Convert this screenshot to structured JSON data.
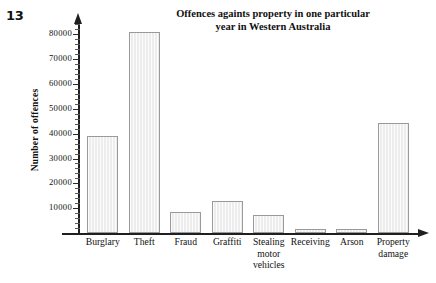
{
  "question_number": "13",
  "chart_data": {
    "type": "bar",
    "title": "Offences againts property in one particular year in Western Australia",
    "title_line1": "Offences againts property in one particular",
    "title_line2": "year in Western Australia",
    "xlabel": "",
    "ylabel": "Number of offences",
    "ylim": [
      0,
      85000
    ],
    "ytick_step": 10000,
    "minor_tick_step": 2000,
    "grid": false,
    "legend": false,
    "bar_fill_color": "#ededed",
    "bar_border_color": "#9a9a9a",
    "axis_color": "#1f1f1f",
    "categories": [
      "Burglary",
      "Theft",
      "Fraud",
      "Graffiti",
      "Stealing\nmotor\nvehicles",
      "Receiving",
      "Arson",
      "Property\ndamage"
    ],
    "values": [
      39000,
      81000,
      8500,
      13000,
      7200,
      1700,
      1500,
      44500
    ],
    "ytick_labels": [
      "10000",
      "20000",
      "30000",
      "40000",
      "50000",
      "60000",
      "70000",
      "80000"
    ],
    "ytick_values": [
      10000,
      20000,
      30000,
      40000,
      50000,
      60000,
      70000,
      80000
    ]
  }
}
